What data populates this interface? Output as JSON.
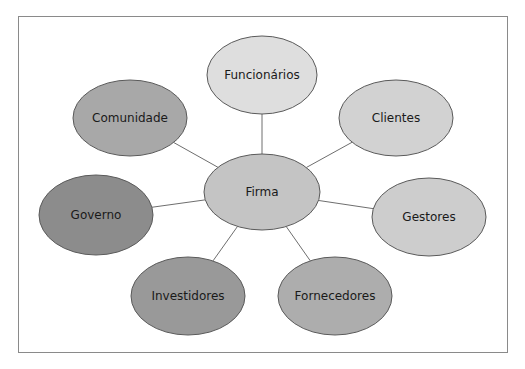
{
  "diagram": {
    "type": "hub-and-spoke",
    "center": {
      "label": "Firma",
      "cx": 262,
      "cy": 192,
      "rx": 58,
      "ry": 38,
      "fill": "#c4c4c4"
    },
    "nodes": [
      {
        "label": "Funcionários",
        "cx": 262,
        "cy": 75,
        "rx": 55,
        "ry": 39,
        "fill": "#dedede"
      },
      {
        "label": "Clientes",
        "cx": 396,
        "cy": 118,
        "rx": 57,
        "ry": 38,
        "fill": "#d2d2d2"
      },
      {
        "label": "Gestores",
        "cx": 429,
        "cy": 217,
        "rx": 57,
        "ry": 39,
        "fill": "#cdcdcd"
      },
      {
        "label": "Fornecedores",
        "cx": 335,
        "cy": 296,
        "rx": 57,
        "ry": 39,
        "fill": "#adadad"
      },
      {
        "label": "Investidores",
        "cx": 188,
        "cy": 296,
        "rx": 57,
        "ry": 39,
        "fill": "#999999"
      },
      {
        "label": "Governo",
        "cx": 96,
        "cy": 215,
        "rx": 57,
        "ry": 40,
        "fill": "#8c8c8c"
      },
      {
        "label": "Comunidade",
        "cx": 130,
        "cy": 118,
        "rx": 57,
        "ry": 38,
        "fill": "#a8a8a8"
      }
    ],
    "edge_color": "#6e6e6e",
    "node_stroke": "#5a5a5a"
  }
}
